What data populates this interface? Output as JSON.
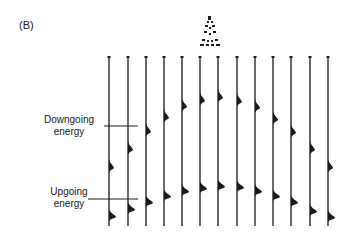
{
  "figure": {
    "panel_label": "(B)",
    "annotations": {
      "downgoing": {
        "line1": "Downgoing",
        "line2": "energy"
      },
      "upgoing": {
        "line1": "Upgoing",
        "line2": "energy"
      }
    },
    "source_icon": "derrick-icon",
    "ink_color": "#1a1a1a",
    "trace_top_y": 57,
    "trace_bottom_y": 226,
    "traces": [
      {
        "x": 109,
        "down_y": 168,
        "up_y": 217
      },
      {
        "x": 128,
        "down_y": 150,
        "up_y": 210
      },
      {
        "x": 146,
        "down_y": 132,
        "up_y": 203
      },
      {
        "x": 164,
        "down_y": 118,
        "up_y": 197
      },
      {
        "x": 182,
        "down_y": 107,
        "up_y": 192
      },
      {
        "x": 200,
        "down_y": 101,
        "up_y": 189
      },
      {
        "x": 218,
        "down_y": 98,
        "up_y": 187
      },
      {
        "x": 237,
        "down_y": 102,
        "up_y": 188
      },
      {
        "x": 255,
        "down_y": 108,
        "up_y": 192
      },
      {
        "x": 273,
        "down_y": 120,
        "up_y": 197
      },
      {
        "x": 291,
        "down_y": 133,
        "up_y": 203
      },
      {
        "x": 310,
        "down_y": 150,
        "up_y": 212
      },
      {
        "x": 328,
        "down_y": 168,
        "up_y": 218
      }
    ]
  }
}
